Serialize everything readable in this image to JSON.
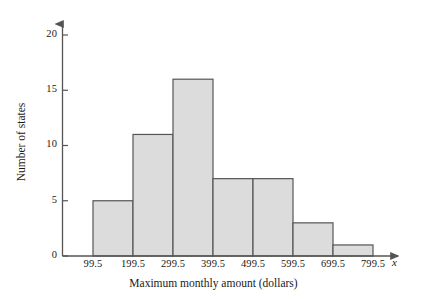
{
  "chart_data": {
    "type": "bar",
    "title": "",
    "subtitle": "",
    "xlabel": "Maximum monthly amount (dollars)",
    "ylabel": "Number of states",
    "x_variable_symbol": "x",
    "categories": [
      "99.5-199.5",
      "199.5-299.5",
      "299.5-399.5",
      "399.5-499.5",
      "499.5-599.5",
      "599.5-699.5",
      "699.5-799.5"
    ],
    "bin_edges": [
      99.5,
      199.5,
      299.5,
      399.5,
      499.5,
      599.5,
      699.5,
      799.5
    ],
    "values": [
      5,
      11,
      16,
      7,
      7,
      3,
      1
    ],
    "xtick_labels": [
      "99.5",
      "199.5",
      "299.5",
      "399.5",
      "499.5",
      "599.5",
      "699.5",
      "799.5"
    ],
    "ytick_labels": [
      "0",
      "5",
      "10",
      "15",
      "20"
    ],
    "ytick_values": [
      0,
      5,
      10,
      15,
      20
    ],
    "ylim": [
      0,
      21
    ],
    "xlim": [
      99.5,
      799.5
    ],
    "grid": false,
    "legend": null,
    "legend_position": "none",
    "bar_fill_color": "#dcdcdc",
    "bar_edge_color": "#555555",
    "axis_color": "#555555",
    "text_color": "#1a1a1a",
    "background_color": "#ffffff",
    "annotations": []
  }
}
